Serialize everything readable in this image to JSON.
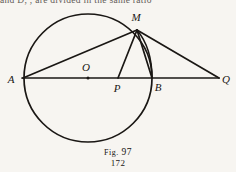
{
  "page": {
    "background_color": "#f7f5f1",
    "ink_color": "#1a1714",
    "truncated_header_text": "and  D,  ,  are  divided  in  the  same  ratio",
    "page_number": "172"
  },
  "caption": {
    "prefix": "Fig.",
    "number": "97",
    "full": "Fig. 97"
  },
  "figure": {
    "title": "Fig. 97",
    "circle": {
      "center_label": "O",
      "cx": 88,
      "cy": 78,
      "r": 64,
      "stroke_width": 1.6
    },
    "points": [
      {
        "label": "A",
        "x": 24,
        "y": 78,
        "label_x": 11,
        "label_y": 82,
        "on_circle": true,
        "marker": false
      },
      {
        "label": "O",
        "x": 88,
        "y": 78,
        "label_x": 84,
        "label_y": 70,
        "on_circle": false,
        "marker": true
      },
      {
        "label": "P",
        "x": 118,
        "y": 78,
        "label_x": 114,
        "label_y": 91,
        "on_circle": false,
        "marker": false
      },
      {
        "label": "B",
        "x": 152,
        "y": 78,
        "label_x": 155,
        "label_y": 90,
        "on_circle": true,
        "marker": false
      },
      {
        "label": "Q",
        "x": 218,
        "y": 78,
        "label_x": 222,
        "label_y": 83,
        "on_circle": false,
        "marker": false
      },
      {
        "label": "M",
        "x": 137,
        "y": 29,
        "label_x": 134,
        "label_y": 22,
        "on_circle": true,
        "marker": false
      }
    ],
    "segments": [
      {
        "name": "AQ",
        "from": "A",
        "to": "Q",
        "x1": 22,
        "y1": 78,
        "x2": 219,
        "y2": 78
      },
      {
        "name": "AM",
        "from": "A",
        "to": "M",
        "x1": 23,
        "y1": 78,
        "x2": 137,
        "y2": 30
      },
      {
        "name": "MP",
        "from": "M",
        "to": "P",
        "x1": 137,
        "y1": 30,
        "x2": 118,
        "y2": 78
      },
      {
        "name": "MB",
        "from": "M",
        "to": "B",
        "x1": 137,
        "y1": 30,
        "x2": 152,
        "y2": 78
      },
      {
        "name": "MQ",
        "from": "M",
        "to": "Q",
        "x1": 137,
        "y1": 30,
        "x2": 219,
        "y2": 78
      }
    ],
    "arcs": [
      {
        "name": "arc-MB",
        "from": "M",
        "to": "B",
        "d": "M 137 30 Q 152 48 152 78"
      }
    ]
  }
}
